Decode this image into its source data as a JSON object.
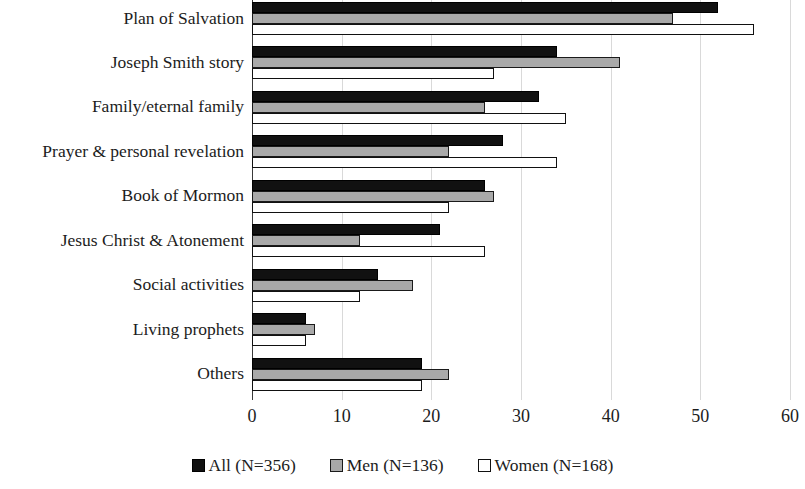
{
  "chart_data": {
    "type": "bar",
    "orientation": "horizontal",
    "title": "",
    "subtitle": "",
    "xlabel": "",
    "ylabel": "",
    "xlim": [
      0,
      60
    ],
    "xticks": [
      0,
      10,
      20,
      30,
      40,
      50,
      60
    ],
    "xtick_labels": [
      "0",
      "10",
      "20",
      "30",
      "40",
      "50",
      "60"
    ],
    "grid": true,
    "grid_axis": "x",
    "legend_position": "bottom",
    "categories": [
      "Plan of Salvation",
      "Joseph Smith story",
      "Family/eternal family",
      "Prayer & personal revelation",
      "Book of Mormon",
      "Jesus Christ & Atonement",
      "Social activities",
      "Living prophets",
      "Others"
    ],
    "series": [
      {
        "name": "All (N=356)",
        "key": "all",
        "color": "#111111",
        "values": [
          52,
          34,
          32,
          28,
          26,
          21,
          14,
          6,
          19
        ]
      },
      {
        "name": "Men (N=136)",
        "key": "men",
        "color": "#a9a9a9",
        "values": [
          47,
          41,
          26,
          22,
          27,
          12,
          18,
          7,
          22
        ]
      },
      {
        "name": "Women (N=168)",
        "key": "women",
        "color": "#ffffff",
        "values": [
          56,
          27,
          35,
          34,
          22,
          26,
          12,
          6,
          19
        ]
      }
    ]
  },
  "legend": {
    "items": [
      {
        "label": "All (N=356)",
        "swatch": "all"
      },
      {
        "label": "Men (N=136)",
        "swatch": "men"
      },
      {
        "label": "Women (N=168)",
        "swatch": "women"
      }
    ]
  }
}
